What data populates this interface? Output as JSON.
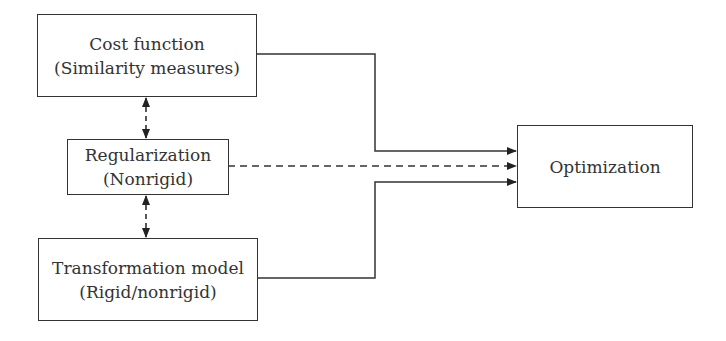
{
  "diagram": {
    "nodes": [
      {
        "id": "cost",
        "title": "Cost function",
        "subtitle": "(Similarity measures)"
      },
      {
        "id": "reg",
        "title": "Regularization",
        "subtitle": "(Nonrigid)"
      },
      {
        "id": "trans",
        "title": "Transformation model",
        "subtitle": "(Rigid/nonrigid)"
      },
      {
        "id": "opt",
        "title": "Optimization"
      }
    ],
    "edges": [
      {
        "from": "cost",
        "to": "reg",
        "style": "dashed",
        "direction": "both"
      },
      {
        "from": "reg",
        "to": "trans",
        "style": "dashed",
        "direction": "both"
      },
      {
        "from": "cost",
        "to": "opt",
        "style": "solid",
        "direction": "forward"
      },
      {
        "from": "reg",
        "to": "opt",
        "style": "dashed",
        "direction": "forward"
      },
      {
        "from": "trans",
        "to": "opt",
        "style": "solid",
        "direction": "forward"
      }
    ],
    "colors": {
      "stroke": "#333333",
      "background": "#ffffff"
    }
  }
}
